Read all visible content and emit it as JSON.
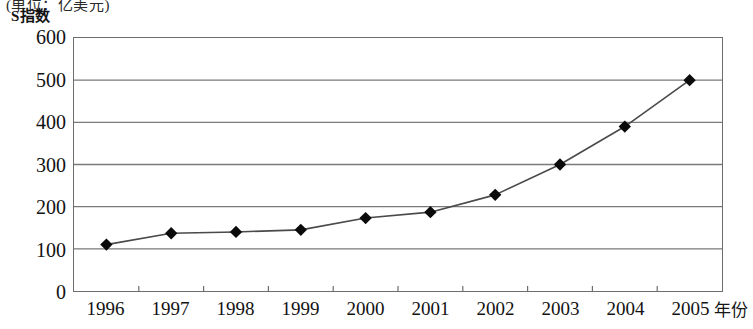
{
  "figure": {
    "unit_note": "(单位：亿美元)",
    "y_axis_title": "S指数",
    "x_axis_title": "年份"
  },
  "chart_data": {
    "type": "line",
    "title": "S指数",
    "subtitle": "(单位：亿美元)",
    "xlabel": "年份",
    "ylabel": "S指数",
    "categories": [
      "1996",
      "1997",
      "1998",
      "1999",
      "2000",
      "2001",
      "2002",
      "2003",
      "2004",
      "2005"
    ],
    "values": [
      110,
      137,
      140,
      145,
      173,
      187,
      228,
      300,
      390,
      500
    ],
    "series": [
      {
        "name": "S指数",
        "values": [
          110,
          137,
          140,
          145,
          173,
          187,
          228,
          300,
          390,
          500
        ]
      }
    ],
    "ylim": [
      0,
      600
    ],
    "ytick_labels": [
      "0",
      "100",
      "200",
      "300",
      "400",
      "500",
      "600"
    ],
    "ytick_values": [
      0,
      100,
      200,
      300,
      400,
      500,
      600
    ],
    "xtick_labels": [
      "1996",
      "1997",
      "1998",
      "1999",
      "2000",
      "2001",
      "2002",
      "2003",
      "2004",
      "2005"
    ],
    "grid": "horizontal",
    "legend": "none",
    "marker": "diamond",
    "line_color": "#4a4a4a",
    "marker_color": "#0b0b0b",
    "grid_color": "#7a7a7a",
    "frame_color": "#6e6e6e"
  }
}
